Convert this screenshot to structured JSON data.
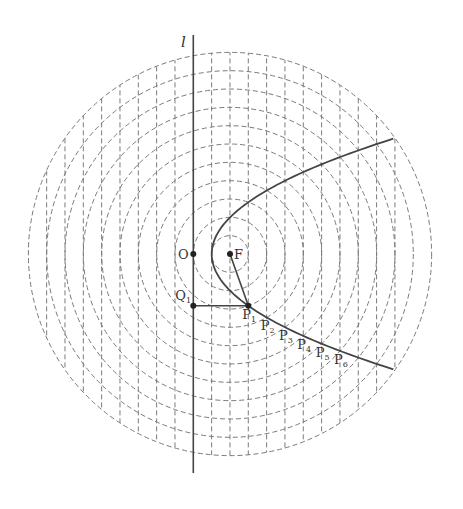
{
  "diagram": {
    "type": "parabola-construction",
    "colors": {
      "background": "#ffffff",
      "solid_line": "#444444",
      "dashed_line": "#7a7a7a",
      "label": "#333333"
    },
    "geometry": {
      "unit_px": 18.33,
      "focus": {
        "x": 230,
        "y": 254
      },
      "origin": {
        "x": 193.3,
        "y": 254
      },
      "circle_count": 11,
      "vertical_line_count_right": 11,
      "vertical_line_count_left": 9,
      "directrix_x": 193.3,
      "directrix_y_top": 35,
      "directrix_y_bottom": 473,
      "parabola_vertex": {
        "x": 211.7,
        "y": 254
      },
      "parabola_end_x": 393.3
    },
    "labels": {
      "directrix": "l",
      "origin": "O",
      "focus": "F",
      "q1": {
        "base": "Q",
        "sub": "1"
      },
      "points": [
        {
          "base": "P",
          "sub": "1"
        },
        {
          "base": "P",
          "sub": "2"
        },
        {
          "base": "P",
          "sub": "3"
        },
        {
          "base": "P",
          "sub": "4"
        },
        {
          "base": "P",
          "sub": "5"
        },
        {
          "base": "P",
          "sub": "6"
        }
      ]
    }
  }
}
